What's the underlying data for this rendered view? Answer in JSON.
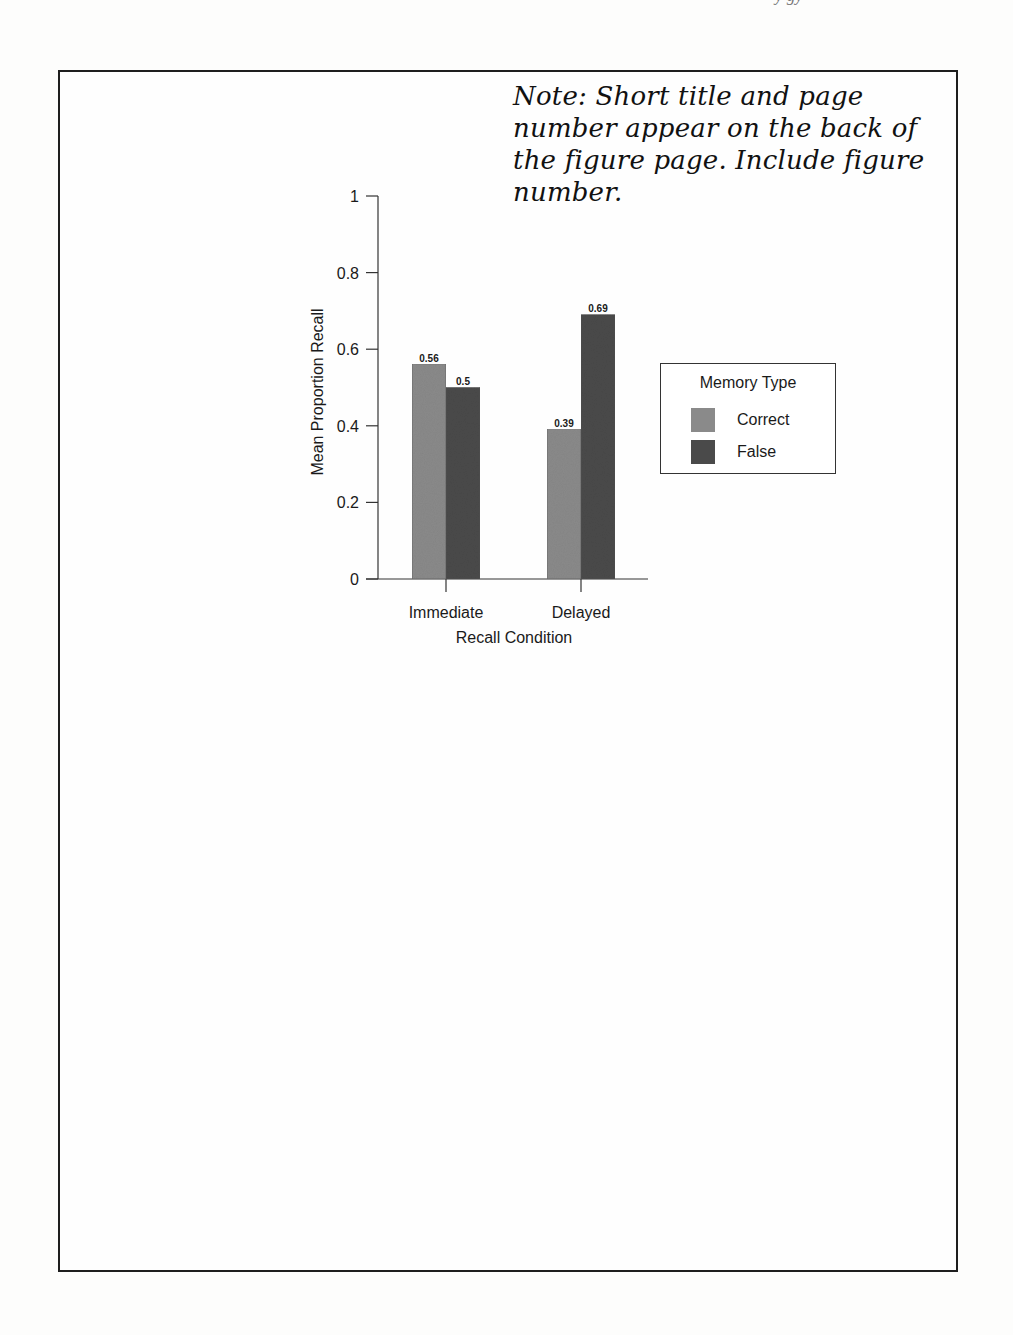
{
  "header_fragment": "y  gy",
  "note": {
    "lines": [
      "Note: Short title and page",
      "number appear on the back of",
      "the figure page. Include figure",
      "number."
    ]
  },
  "chart_data": {
    "type": "bar",
    "title": "",
    "xlabel": "Recall Condition",
    "ylabel": "Mean Proportion Recall",
    "categories": [
      "Immediate",
      "Delayed"
    ],
    "series": [
      {
        "name": "Correct",
        "values": [
          0.56,
          0.39
        ],
        "color": "#8a8a8a"
      },
      {
        "name": "False",
        "values": [
          0.5,
          0.69
        ],
        "color": "#4a4a4a"
      }
    ],
    "data_labels": [
      [
        "0.56",
        "0.5"
      ],
      [
        "0.39",
        "0.69"
      ]
    ],
    "ylim": [
      0,
      1
    ],
    "yticks": [
      "0",
      "0.2",
      "0.4",
      "0.6",
      "0.8",
      "1"
    ],
    "grid": false,
    "legend": {
      "title": "Memory Type",
      "position": "right",
      "entries": [
        "Correct",
        "False"
      ]
    }
  }
}
